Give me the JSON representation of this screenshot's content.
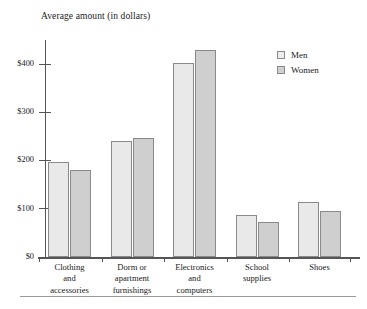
{
  "chart_data": {
    "type": "bar",
    "title": "",
    "axis_title": "Average amount (in dollars)",
    "xlabel": "",
    "ylabel": "Average amount (in dollars)",
    "categories": [
      "Clothing\nand\naccessories",
      "Dorm or\napartment\nfurnishings",
      "Electronics\nand\ncomputers",
      "School\nsupplies",
      "Shoes"
    ],
    "series": [
      {
        "name": "Men",
        "values": [
          196,
          240,
          403,
          88,
          115
        ]
      },
      {
        "name": "Women",
        "values": [
          180,
          247,
          430,
          73,
          95
        ]
      }
    ],
    "ylim": [
      0,
      450
    ],
    "yticks": [
      0,
      100,
      200,
      300,
      400
    ],
    "ytick_labels": [
      "$0",
      "$100",
      "$200",
      "$300",
      "$400"
    ],
    "grid": false,
    "legend_position": "top-right",
    "colors": {
      "men": "#e9e9e9",
      "women": "#cfcfcf",
      "bar_border": "#8a8a8a",
      "axis": "#555555",
      "text": "#1a1a1a"
    }
  },
  "legend": {
    "items": [
      {
        "label": "Men"
      },
      {
        "label": "Women"
      }
    ]
  }
}
